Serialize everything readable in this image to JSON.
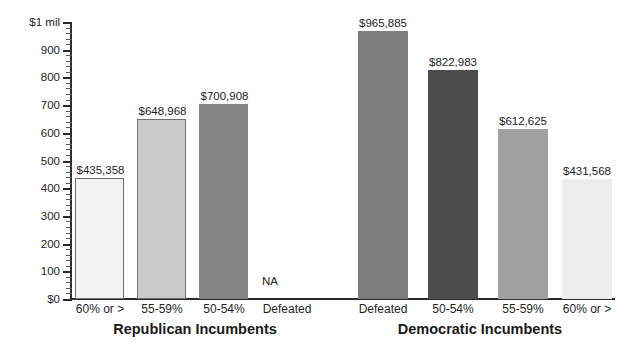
{
  "chart_data": {
    "type": "bar",
    "title": "",
    "subtitle": "",
    "xlabel": "",
    "ylabel": "",
    "ylim": [
      0,
      1000000
    ],
    "grid": false,
    "legend": null,
    "y_axis": {
      "top_label": "$1 mil",
      "bottom_label": "$0",
      "tick_labels": [
        "$1 mil",
        "900",
        "800",
        "700",
        "600",
        "500",
        "400",
        "300",
        "200",
        "100",
        "$0"
      ],
      "tick_values": [
        1000000,
        900000,
        800000,
        700000,
        600000,
        500000,
        400000,
        300000,
        200000,
        100000,
        0
      ],
      "minor_ticks_per_interval": 5
    },
    "groups": [
      {
        "name": "Republican Incumbents",
        "categories": [
          "60% or >",
          "55-59%",
          "50-54%",
          "Defeated"
        ],
        "values": [
          435358,
          648968,
          700908,
          null
        ],
        "value_labels": [
          "$435,358",
          "$648,968",
          "$700,908",
          "NA"
        ],
        "bar_colors": [
          "#f2f2f2",
          "#cacaca",
          "#848484",
          "none"
        ]
      },
      {
        "name": "Democratic Incumbents",
        "categories": [
          "Defeated",
          "50-54%",
          "55-59%",
          "60% or >"
        ],
        "values": [
          965885,
          822983,
          612625,
          431568
        ],
        "value_labels": [
          "$965,885",
          "$822,983",
          "$612,625",
          "$431,568"
        ],
        "bar_colors": [
          "#7d7d7d",
          "#4c4c4c",
          "#a0a0a0",
          "#ededed"
        ]
      }
    ],
    "axis_color": "#2b2b2b",
    "background_color": "#ffffff"
  },
  "bars": [
    {
      "label": "$435,358",
      "category": "60% or >",
      "value": 435358,
      "color": "#f2f2f2",
      "outlined": true,
      "left": 75,
      "width": 49,
      "height": 121,
      "label_left": 70,
      "label_top": 165
    },
    {
      "label": "$648,968",
      "category": "55-59%",
      "value": 648968,
      "color": "#cacaca",
      "outlined": true,
      "left": 137,
      "width": 49,
      "height": 180,
      "label_left": 132,
      "label_top": 106
    },
    {
      "label": "$700,908",
      "category": "50-54%",
      "value": 700908,
      "color": "#848484",
      "outlined": false,
      "left": 199,
      "width": 49,
      "height": 195,
      "label_left": 194,
      "label_top": 91
    },
    {
      "label": "NA",
      "category": "Defeated",
      "value": null,
      "color": "none",
      "outlined": false,
      "left": 261,
      "width": 49,
      "height": 0,
      "label_left": 262,
      "label_top": 276
    },
    {
      "label": "$965,885",
      "category": "Defeated",
      "value": 965885,
      "color": "#7d7d7d",
      "outlined": false,
      "left": 358,
      "width": 50,
      "height": 268,
      "label_left": 352,
      "label_top": 18
    },
    {
      "label": "$822,983",
      "category": "50-54%",
      "value": 822983,
      "color": "#4c4c4c",
      "outlined": false,
      "left": 428,
      "width": 50,
      "height": 229,
      "label_left": 422,
      "label_top": 57
    },
    {
      "label": "$612,625",
      "category": "55-59%",
      "value": 612625,
      "color": "#a0a0a0",
      "outlined": false,
      "left": 498,
      "width": 50,
      "height": 170,
      "label_left": 492,
      "label_top": 116
    },
    {
      "label": "$431,568",
      "category": "60% or >",
      "value": 431568,
      "color": "#ededed",
      "outlined": false,
      "left": 562,
      "width": 50,
      "height": 120,
      "label_left": 556,
      "label_top": 166
    }
  ],
  "y_ticks": [
    {
      "label": "$1 mil",
      "top": 22
    },
    {
      "label": "900",
      "top": 49.7
    },
    {
      "label": "800",
      "top": 77.4
    },
    {
      "label": "700",
      "top": 105.1
    },
    {
      "label": "600",
      "top": 132.8
    },
    {
      "label": "500",
      "top": 160.5
    },
    {
      "label": "400",
      "top": 188.2
    },
    {
      "label": "300",
      "top": 215.9
    },
    {
      "label": "200",
      "top": 243.6
    },
    {
      "label": "100",
      "top": 271.3
    },
    {
      "label": "$0",
      "top": 299
    }
  ],
  "category_labels": [
    {
      "text": "60% or >",
      "left": 67,
      "width": 66
    },
    {
      "text": "55-59%",
      "left": 129,
      "width": 66
    },
    {
      "text": "50-54%",
      "left": 191,
      "width": 66
    },
    {
      "text": "Defeated",
      "left": 252,
      "width": 70
    },
    {
      "text": "Defeated",
      "left": 348,
      "width": 70
    },
    {
      "text": "50-54%",
      "left": 420,
      "width": 66
    },
    {
      "text": "55-59%",
      "left": 490,
      "width": 66
    },
    {
      "text": "60% or >",
      "left": 554,
      "width": 66
    }
  ],
  "group_labels": [
    {
      "text": "Republican Incumbents",
      "left": 60,
      "width": 270
    },
    {
      "text": "Democratic Incumbents",
      "left": 340,
      "width": 280
    }
  ]
}
